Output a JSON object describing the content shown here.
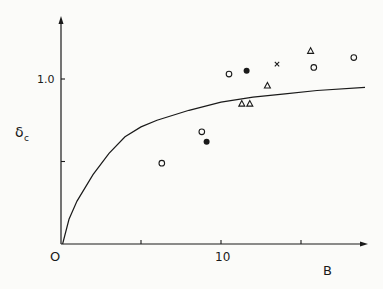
{
  "chart_data": {
    "type": "scatter",
    "title": "",
    "xlabel": "B",
    "ylabel": "δc",
    "ylabel_main": "δ",
    "ylabel_sub": "c",
    "origin_label": "O",
    "xlim": [
      0,
      19
    ],
    "ylim": [
      0,
      1.35
    ],
    "x_ticks": [
      5,
      10,
      15
    ],
    "x_tick_labels": [
      "",
      "10",
      ""
    ],
    "y_ticks": [
      0.5,
      1.0
    ],
    "y_tick_labels": [
      "",
      "1.0"
    ],
    "grid": false,
    "legend": null,
    "series": [
      {
        "name": "open circles",
        "marker": "circle-open",
        "points": [
          [
            6.3,
            0.49
          ],
          [
            8.8,
            0.68
          ],
          [
            10.5,
            1.03
          ],
          [
            15.8,
            1.07
          ],
          [
            18.3,
            1.13
          ]
        ]
      },
      {
        "name": "filled circles",
        "marker": "circle-filled",
        "points": [
          [
            9.1,
            0.62
          ],
          [
            11.6,
            1.05
          ]
        ]
      },
      {
        "name": "triangles",
        "marker": "triangle-open",
        "points": [
          [
            11.3,
            0.85
          ],
          [
            11.8,
            0.85
          ],
          [
            12.9,
            0.96
          ],
          [
            15.6,
            1.17
          ]
        ]
      },
      {
        "name": "cross",
        "marker": "x",
        "points": [
          [
            13.5,
            1.09
          ]
        ]
      },
      {
        "name": "theory curve",
        "marker": "line",
        "points": [
          [
            0.1,
            0
          ],
          [
            0.5,
            0.15
          ],
          [
            1,
            0.26
          ],
          [
            2,
            0.42
          ],
          [
            3,
            0.55
          ],
          [
            4,
            0.65
          ],
          [
            5,
            0.71
          ],
          [
            6,
            0.75
          ],
          [
            8,
            0.81
          ],
          [
            10,
            0.86
          ],
          [
            12,
            0.89
          ],
          [
            14,
            0.91
          ],
          [
            16,
            0.93
          ],
          [
            19,
            0.95
          ]
        ]
      }
    ]
  }
}
